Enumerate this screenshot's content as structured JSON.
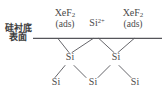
{
  "figure": {
    "background_color": "#ffffff",
    "line_color": "#55555a",
    "text_color": "#4a4a4a"
  },
  "substrate": {
    "caption_line1": "硅衬底",
    "caption_line2": "表面"
  },
  "adsorbates": [
    {
      "id": "xef2-left",
      "formula_main": "XeF",
      "formula_sub": "2",
      "state": "(ads)"
    },
    {
      "id": "xef2-right",
      "formula_main": "XeF",
      "formula_sub": "2",
      "state": "(ads)"
    }
  ],
  "ion": {
    "symbol": "Si",
    "charge": "2+"
  },
  "lattice": {
    "middle_row": [
      {
        "id": "atom-mid-left",
        "symbol": "Si"
      },
      {
        "id": "atom-mid-right",
        "symbol": "Si"
      }
    ],
    "bottom_row": [
      {
        "id": "atom-bot-left",
        "symbol": "Si"
      },
      {
        "id": "atom-bot-center",
        "symbol": "Si"
      },
      {
        "id": "atom-bot-right",
        "symbol": "Si"
      }
    ]
  },
  "surface_line": {
    "label": "substrate-surface-line",
    "x1": 33,
    "y1": 38,
    "x2": 162,
    "y2": 38
  },
  "bonds": [
    {
      "name": "bond-surface-left-to-mid-left",
      "x1": 58,
      "y1": 38,
      "x2": 69,
      "y2": 53
    },
    {
      "name": "bond-surface-center-to-mid-left",
      "x1": 93,
      "y1": 38,
      "x2": 71,
      "y2": 53
    },
    {
      "name": "bond-surface-center-to-mid-right",
      "x1": 98,
      "y1": 38,
      "x2": 114,
      "y2": 53
    },
    {
      "name": "bond-surface-right-to-mid-right",
      "x1": 133,
      "y1": 38,
      "x2": 117,
      "y2": 53
    },
    {
      "name": "bond-mid-left-to-bot-left",
      "x1": 66,
      "y1": 65,
      "x2": 55,
      "y2": 78
    },
    {
      "name": "bond-mid-left-to-bot-center",
      "x1": 73,
      "y1": 65,
      "x2": 88,
      "y2": 78
    },
    {
      "name": "bond-mid-right-to-bot-center",
      "x1": 111,
      "y1": 65,
      "x2": 96,
      "y2": 78
    },
    {
      "name": "bond-mid-right-to-bot-right",
      "x1": 118,
      "y1": 65,
      "x2": 132,
      "y2": 78
    }
  ]
}
